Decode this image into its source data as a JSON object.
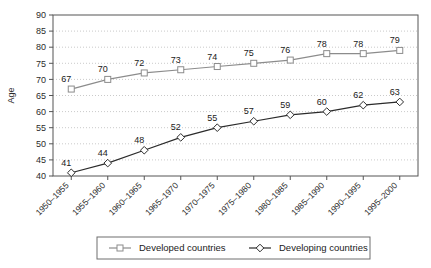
{
  "chart_data": {
    "type": "line",
    "title": "",
    "subtitle": "",
    "xlabel": "",
    "ylabel": "Age",
    "ylim": [
      40,
      90
    ],
    "ytick_step": 5,
    "yticks": [
      "40",
      "45",
      "50",
      "55",
      "60",
      "65",
      "70",
      "75",
      "80",
      "85",
      "90"
    ],
    "grid": true,
    "grid_style": "dotted-horizontal",
    "legend_position": "bottom",
    "categories": [
      "1950–1955",
      "1955–1960",
      "1960–1965",
      "1965–1970",
      "1970–1975",
      "1975–1980",
      "1980–1985",
      "1985–1990",
      "1990–1995",
      "1995–2000"
    ],
    "series": [
      {
        "name": "Developed countries",
        "marker": "square-open",
        "color": "#8c8c8c",
        "values": [
          67,
          70,
          72,
          73,
          74,
          75,
          76,
          78,
          78,
          79
        ]
      },
      {
        "name": "Developing countries",
        "marker": "diamond-open",
        "color": "#2b2b2b",
        "values": [
          41,
          44,
          48,
          52,
          55,
          57,
          59,
          60,
          62,
          63
        ]
      }
    ]
  },
  "legend": {
    "items": [
      {
        "label": "Developed countries"
      },
      {
        "label": "Developing countries"
      }
    ]
  },
  "colors": {
    "developed": "#8c8c8c",
    "developing": "#2b2b2b",
    "grid": "#bdbdbd",
    "axis": "#555555",
    "background": "#ffffff"
  }
}
